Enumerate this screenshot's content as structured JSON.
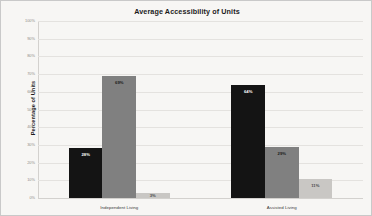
{
  "chart_data": {
    "type": "bar",
    "title": "Average Accessibility of Units",
    "xlabel": "",
    "ylabel": "Percentage of Units",
    "categories": [
      "Independent Living",
      "Assisted Living"
    ],
    "series": [
      {
        "name": "Series 1",
        "color": "#141414",
        "values": [
          28,
          64
        ],
        "labels": [
          "28%",
          "64%"
        ],
        "label_color": "#ffffff"
      },
      {
        "name": "Series 2",
        "color": "#808080",
        "values": [
          69,
          29
        ],
        "labels": [
          "69%",
          "29%"
        ],
        "label_color": "#1a1a1a"
      },
      {
        "name": "Series 3",
        "color": "#c9c7c4",
        "values": [
          3,
          11
        ],
        "labels": [
          "3%",
          "11%"
        ],
        "label_color": "#4a4a4a"
      }
    ],
    "ylim": [
      0,
      100
    ],
    "yticks": [
      0,
      10,
      20,
      30,
      40,
      50,
      60,
      70,
      80,
      90,
      100
    ],
    "ytick_labels": [
      "0%",
      "10%",
      "20%",
      "30%",
      "40%",
      "50%",
      "60%",
      "70%",
      "80%",
      "90%",
      "100%"
    ],
    "grid": true,
    "legend": "none",
    "background": "#f7f6f4",
    "gridline_color": "#e4e2df"
  }
}
